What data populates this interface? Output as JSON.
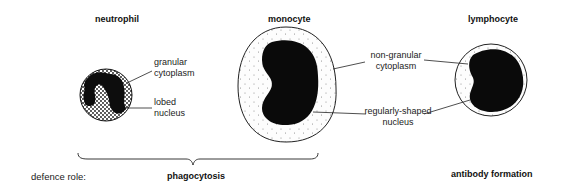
{
  "cells": {
    "neutrophil": {
      "title": "neutrophil",
      "labels": {
        "cytoplasm_line1": "granular",
        "cytoplasm_line2": "cytoplasm",
        "nucleus_line1": "lobed",
        "nucleus_line2": "nucleus"
      }
    },
    "monocyte": {
      "title": "monocyte"
    },
    "lymphocyte": {
      "title": "lymphocyte"
    }
  },
  "shared_labels": {
    "cytoplasm_line1": "non-granular",
    "cytoplasm_line2": "cytoplasm",
    "nucleus_line1": "regularly-shaped",
    "nucleus_line2": "nucleus"
  },
  "defence": {
    "label": "defence role:",
    "phagocytosis": "phagocytosis",
    "antibody": "antibody formation"
  }
}
